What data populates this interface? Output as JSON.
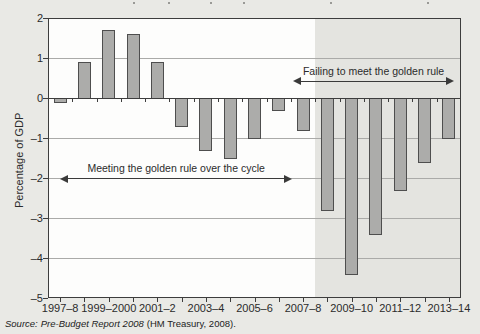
{
  "page": {
    "background": "#e9e9e5"
  },
  "cropped_title": {
    "fragments_x": [
      133,
      168,
      210,
      243,
      330,
      427
    ]
  },
  "source": {
    "prefix": "Source:",
    "work": "Pre-Budget Report 2008",
    "rest": "(HM Treasury, 2008)."
  },
  "chart_data": {
    "type": "bar",
    "ylabel": "Percentage of GDP",
    "ylim": [
      -5,
      2
    ],
    "yticks": [
      2,
      1,
      0,
      -1,
      -2,
      -3,
      -4,
      -5
    ],
    "grid": true,
    "legend_position": "none",
    "categories": [
      "1997–8",
      "1998–9",
      "1999–2000",
      "2000–1",
      "2001–2",
      "2002–3",
      "2003–4",
      "2004–5",
      "2005–6",
      "2006–7",
      "2007–8",
      "2008–9",
      "2009–10",
      "2010–11",
      "2011–12",
      "2012–13",
      "2013–14"
    ],
    "values": [
      -0.1,
      0.9,
      1.7,
      1.6,
      0.9,
      -0.7,
      -1.3,
      -1.5,
      -1.0,
      -0.3,
      -0.8,
      -2.8,
      -4.4,
      -3.4,
      -2.3,
      -1.6,
      -1.0
    ],
    "xtick_label_indices": [
      0,
      2,
      4,
      6,
      8,
      10,
      12,
      14,
      16
    ],
    "shaded_region": {
      "from_category": "2008–9",
      "to_category": "2013–14",
      "color": "#e4e4e0"
    },
    "annotations": [
      {
        "text": "Meeting the golden rule over the cycle",
        "arrow_y": -2.0,
        "from_slot": 0.5,
        "to_slot": 10.05
      },
      {
        "text": "Failing to meet the golden rule",
        "arrow_y": 0.43,
        "from_slot": 10.1,
        "to_slot": 16.7
      }
    ],
    "colors": {
      "bar_fill": "#acacaa",
      "bar_border": "#4e4e4e",
      "gridline": "#aaaaa8",
      "axis": "#3d3d3d",
      "text": "#2b2b2b"
    }
  }
}
